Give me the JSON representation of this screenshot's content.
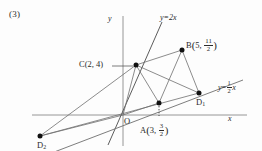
{
  "figure": {
    "problem_number": "(3)",
    "axes": {
      "x_label": "x",
      "y_label": "y",
      "origin_label": "O"
    },
    "lines": [
      {
        "name": "line-y-equals-2x",
        "label_lhs": "y",
        "label_eq": "=",
        "label_rhs": "2x",
        "slope": 2,
        "full_label": "y=2x"
      },
      {
        "name": "line-y-equals-half-x",
        "label_lhs": "y",
        "label_eq": "=",
        "frac_num": "1",
        "frac_den": "2",
        "label_rhs": "x",
        "slope": 0.5,
        "full_label": "y=(1/2)x"
      }
    ],
    "points": [
      {
        "id": "A",
        "letter": "A",
        "x": "3",
        "y_num": "3",
        "y_den": "2",
        "label": "A(3, 3/2)"
      },
      {
        "id": "B",
        "letter": "B",
        "x": "5",
        "y_num": "11",
        "y_den": "2",
        "label": "B(5, 11/2)"
      },
      {
        "id": "C",
        "letter": "C",
        "x": "2",
        "y": "4",
        "label": "C(2, 4)"
      },
      {
        "id": "D1",
        "letter": "D",
        "subscript": "1",
        "label": "D1"
      },
      {
        "id": "D2",
        "letter": "D",
        "subscript": "2",
        "label": "D2"
      }
    ],
    "colors": {
      "ink": "#2b2b2b",
      "axis": "#8a8a8a",
      "construction": "#6e6e6e",
      "point": "#111111",
      "background": "#fdfdfd"
    }
  }
}
